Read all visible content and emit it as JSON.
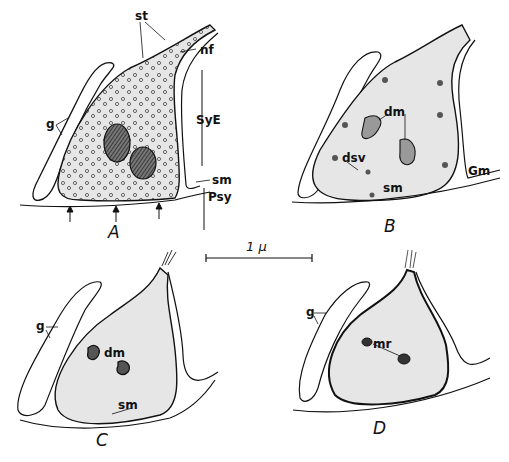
{
  "figure": {
    "panels": [
      {
        "id": "A",
        "label": "A",
        "labels": [
          "st",
          "nf",
          "g",
          "SyE",
          "sm",
          "Psy"
        ]
      },
      {
        "id": "B",
        "label": "B",
        "labels": [
          "dm",
          "dsv",
          "sm",
          "Gm"
        ]
      },
      {
        "id": "C",
        "label": "C",
        "labels": [
          "g",
          "dm",
          "sm"
        ]
      },
      {
        "id": "D",
        "label": "D",
        "labels": [
          "g",
          "mr"
        ]
      }
    ],
    "scale_bar": {
      "label": "1 μ"
    },
    "text": {
      "A": {
        "st": "st",
        "nf": "nf",
        "g": "g",
        "SyE": "SyE",
        "sm": "sm",
        "Psy": "Psy",
        "panel": "A"
      },
      "B": {
        "dm": "dm",
        "dsv": "dsv",
        "sm": "sm",
        "Gm": "Gm",
        "panel": "B"
      },
      "C": {
        "g": "g",
        "dm": "dm",
        "sm": "sm",
        "panel": "C"
      },
      "D": {
        "g": "g",
        "mr": "mr",
        "panel": "D"
      }
    },
    "colors": {
      "ink": "#111111",
      "cell_fill": "#e6e6e6",
      "background": "#ffffff"
    }
  }
}
